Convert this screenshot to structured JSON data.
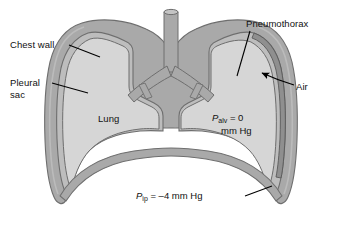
{
  "labels": {
    "chest_wall": "Chest wall",
    "pleural_sac": "Pleural\nsac",
    "pneumothorax": "Pneumothorax",
    "air": "Air",
    "lung": "Lung"
  },
  "pressures": {
    "alveolar": {
      "symbol": "P",
      "subscript": "alv",
      "equals": " = 0",
      "units": "mm Hg"
    },
    "intrapleural": {
      "symbol": "P",
      "subscript": "ip",
      "equals": " = –4 mm Hg",
      "units": ""
    }
  },
  "colors": {
    "background": "#ffffff",
    "lung_fill": "#d6d6d6",
    "chest_wall_fill": "#a9a9a9",
    "pleural_fill": "#bdbdbd",
    "outline": "#6e6e6e",
    "dark_outline": "#555555",
    "text": "#111111",
    "leader": "#000000"
  }
}
